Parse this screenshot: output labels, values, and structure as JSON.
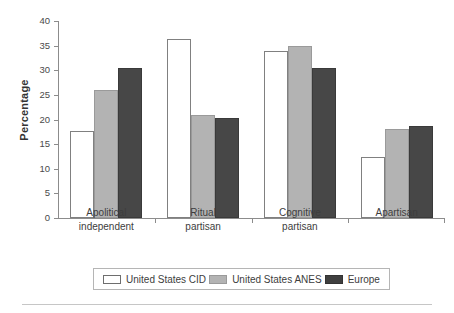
{
  "chart_data": {
    "type": "bar",
    "title": "",
    "xlabel": "",
    "ylabel": "Percentage",
    "ylim": [
      0,
      40
    ],
    "yticks": [
      0,
      5,
      10,
      15,
      20,
      25,
      30,
      35,
      40
    ],
    "grid": false,
    "legend_position": "bottom",
    "categories": [
      "Apolitical independent",
      "Ritual partisan",
      "Cognitive partisan",
      "Apartisan"
    ],
    "category_lines": [
      [
        "Apolitical",
        "independent"
      ],
      [
        "Ritual",
        "partisan"
      ],
      [
        "Cognitive",
        "partisan"
      ],
      [
        "Apartisan",
        ""
      ]
    ],
    "series": [
      {
        "name": "United States CID",
        "color": "#ffffff",
        "edge_color": "#808080",
        "values": [
          17.7,
          36.3,
          33.9,
          12.3
        ]
      },
      {
        "name": "United States ANES",
        "color": "#b3b3b3",
        "edge_color": "#9a9a9a",
        "values": [
          26.0,
          21.0,
          35.0,
          18.1
        ]
      },
      {
        "name": "Europe",
        "color": "#474747",
        "edge_color": "#3a3a3a",
        "values": [
          30.5,
          20.3,
          30.5,
          18.6
        ]
      }
    ]
  },
  "axis": {
    "y_title": "Percentage",
    "y_tick_labels": [
      "40",
      "35",
      "30",
      "25",
      "20",
      "15",
      "10",
      "5",
      "0"
    ]
  },
  "legend": {
    "entries": [
      {
        "label": "United States CID",
        "swatch": "cid"
      },
      {
        "label": "United States ANES",
        "swatch": "anes"
      },
      {
        "label": "Europe",
        "swatch": "eu"
      }
    ]
  }
}
